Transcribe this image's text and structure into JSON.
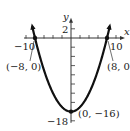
{
  "chart_data": {
    "type": "line",
    "title": "",
    "equation": "y = x^2/4 - 16",
    "xlabel": "x",
    "ylabel": "y",
    "xlim": [
      -10,
      10
    ],
    "ylim": [
      -18,
      2
    ],
    "x_tick_step": 2,
    "y_tick_step": 2,
    "tick_labels": {
      "x": [
        "-10",
        "10"
      ],
      "y": [
        "2",
        "-18"
      ]
    },
    "grid": false,
    "series": [
      {
        "name": "parabola",
        "x": [
          -8.8,
          -8,
          -6,
          -4,
          -2,
          0,
          2,
          4,
          6,
          8,
          8.8
        ],
        "y": [
          3.36,
          0,
          -7,
          -12,
          -15,
          -16,
          -15,
          -12,
          -7,
          0,
          3.36
        ]
      }
    ],
    "points": [
      {
        "x": -8,
        "y": 0,
        "label": "(−8, 0)"
      },
      {
        "x": 8,
        "y": 0,
        "label": "(8, 0)"
      },
      {
        "x": 0,
        "y": -16,
        "label": "(0, −16)"
      }
    ],
    "annotations": [
      "(−8, 0)",
      "(8, 0)",
      "(0, −16)"
    ]
  },
  "labels": {
    "x_axis": "x",
    "y_axis": "y",
    "y_top": "2",
    "y_bottom": "−18",
    "x_left": "−10",
    "x_right": "10",
    "pt_left": "(−8, 0)",
    "pt_right": "(8, 0)",
    "pt_vertex": "(0, −16)"
  },
  "colors": {
    "curve": "#111111",
    "axes": "#333333"
  }
}
